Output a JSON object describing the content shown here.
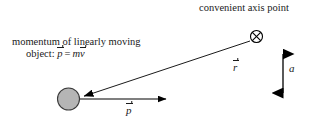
{
  "figure": {
    "width": 316,
    "height": 125,
    "background": "#ffffff",
    "ink_color": "#000000"
  },
  "labels": {
    "axis_point": "convenient axis point",
    "momentum_line1": "momentum of linearly moving",
    "momentum_line2_prefix": "object:",
    "momentum_p_symbol": "p",
    "momentum_equals": "=",
    "momentum_m_symbol": "m",
    "momentum_v_symbol": "v",
    "r_vector_symbol": "r",
    "p_vector_symbol": "p",
    "distance_symbol": "a"
  },
  "shapes": {
    "axis_point_marker": {
      "name": "circle-x-marker",
      "cx": 256.5,
      "cy": 36.5,
      "r": 6.0,
      "stroke": "#000000",
      "fill": "#ffffff"
    },
    "moving_object": {
      "name": "gray-ball",
      "cx": 68.5,
      "cy": 99.0,
      "r": 11.0,
      "fill": "#b5b5b5",
      "stroke": "#3a3a3a"
    },
    "r_arrow": {
      "name": "r-vector-arrow",
      "x1": 250.0,
      "y1": 41.0,
      "x2": 82.0,
      "y2": 96.5,
      "stroke": "#000000"
    },
    "p_arrow": {
      "name": "p-vector-arrow",
      "x1": 80.0,
      "y1": 99.0,
      "x2": 174.0,
      "y2": 99.0,
      "stroke": "#000000"
    },
    "a_arrow": {
      "name": "a-distance-double-arrow",
      "x": 283.0,
      "y1": 42.0,
      "y2": 105.0,
      "stroke": "#000000"
    }
  }
}
